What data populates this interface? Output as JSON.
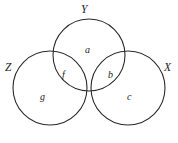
{
  "figure": {
    "type": "venn-diagram",
    "width": 178,
    "height": 143,
    "background_color": "#ffffff",
    "stroke_color": "#2b2b2b",
    "text_color": "#1c1c1c"
  },
  "sets": [
    {
      "id": "Y",
      "label": "Y",
      "position": "top-center",
      "cx": 89,
      "cy": 55,
      "r": 36
    },
    {
      "id": "Z",
      "label": "Z",
      "position": "bottom-left",
      "cx": 50,
      "cy": 88,
      "r": 37
    },
    {
      "id": "X",
      "label": "X",
      "position": "bottom-right",
      "cx": 128,
      "cy": 88,
      "r": 37
    }
  ],
  "regions": [
    {
      "id": "a",
      "label": "a",
      "belongs_to": "Y only",
      "cx": 89,
      "cy": 50
    },
    {
      "id": "b",
      "label": "b",
      "belongs_to": "Y and X",
      "cx": 112,
      "cy": 75
    },
    {
      "id": "c",
      "label": "c",
      "belongs_to": "X only",
      "cx": 131,
      "cy": 97
    },
    {
      "id": "f",
      "label": "f",
      "belongs_to": "Y and Z",
      "cx": 66,
      "cy": 75
    },
    {
      "id": "g",
      "label": "g",
      "belongs_to": "Z only",
      "cx": 44,
      "cy": 97
    }
  ],
  "chart_data": {
    "type": "diagram",
    "title": "",
    "set_labels": [
      "Y",
      "Z",
      "X"
    ],
    "region_labels": [
      "a",
      "b",
      "c",
      "f",
      "g"
    ]
  }
}
